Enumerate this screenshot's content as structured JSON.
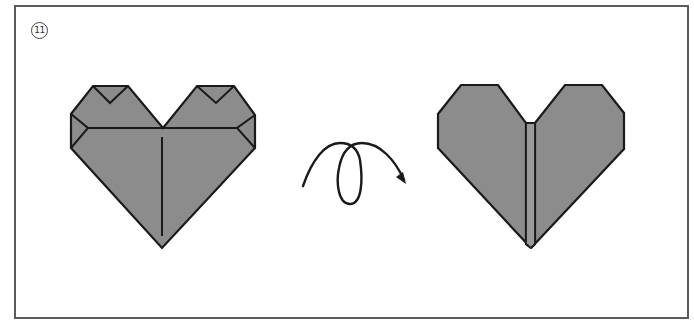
{
  "diagram": {
    "step_number": "11",
    "colors": {
      "paper_fill": "#8c8c8c",
      "outline": "#1a1a1a",
      "frame_border": "#5a5a5a",
      "background": "#ffffff"
    },
    "figures": [
      {
        "id": "heart-folded-front",
        "description": "Folded origami heart, front view with corner folds and center crease"
      },
      {
        "id": "turn-over-arrow",
        "description": "Looping arrow indicating turn the model over"
      },
      {
        "id": "heart-finished",
        "description": "Finished origami heart after turning over"
      }
    ]
  }
}
